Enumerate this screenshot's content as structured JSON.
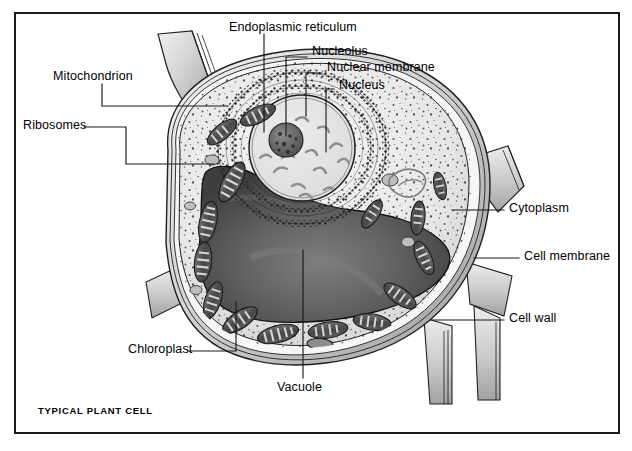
{
  "figure": {
    "caption": "TYPICAL PLANT CELL",
    "frame_color": "#1a1a1a",
    "background": "#ffffff",
    "line_color": "#1a1a1a"
  },
  "labels": {
    "endoplasmic_reticulum": "Endoplasmic reticulum",
    "nucleolus": "Nucleolus",
    "nuclear_membrane": "Nuclear membrane",
    "nucleus": "Nucleus",
    "mitochondrion": "Mitochondrion",
    "ribosomes": "Ribosomes",
    "cytoplasm": "Cytoplasm",
    "cell_membrane": "Cell membrane",
    "cell_wall": "Cell wall",
    "chloroplast": "Chloroplast",
    "vacuole": "Vacuole"
  },
  "palette": {
    "cell_wall_light": "#e4e4e4",
    "cell_wall_mid": "#c4c4c4",
    "cell_wall_dark": "#9a9a9a",
    "cytoplasm": "#ececed",
    "vacuole_dark": "#4c4c4c",
    "vacuole_mid": "#6e6e6e",
    "nucleus_fill": "#e3e3e3",
    "nucleolus": "#6a6a6a",
    "organelle_dark": "#555555",
    "stipple": "#2b2b2b"
  }
}
